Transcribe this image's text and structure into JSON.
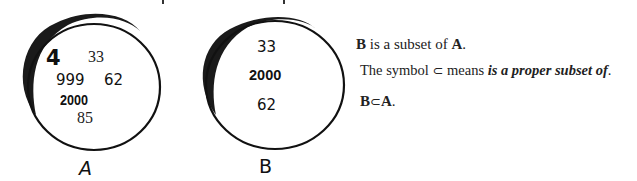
{
  "diagram": {
    "set_a": {
      "label": "A",
      "elements": [
        "4",
        "33",
        "999",
        "62",
        "2000",
        "85"
      ]
    },
    "set_b": {
      "label": "B",
      "elements": [
        "33",
        "2000",
        "62"
      ]
    },
    "text": {
      "line1": {
        "b": "B",
        "middle": " is a subset of ",
        "a": "A",
        "end": "."
      },
      "line2": {
        "prefix": "The symbol ",
        "symbol": "⊂",
        "middle": " means ",
        "emphasis": "is a proper subset of",
        "end": "."
      },
      "line3": {
        "b": "B",
        "symbol": "⊂",
        "a": "A",
        "end": "."
      }
    }
  }
}
